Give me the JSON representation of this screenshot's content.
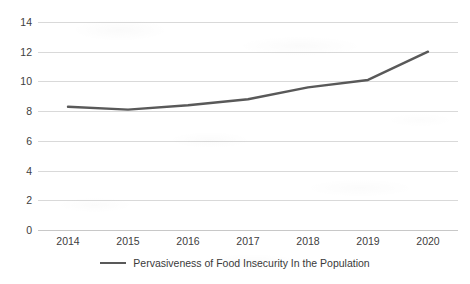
{
  "chart_data": {
    "type": "line",
    "title": "",
    "subtitle": "",
    "xlabel": "",
    "ylabel": "",
    "categories": [
      "2014",
      "2015",
      "2016",
      "2017",
      "2018",
      "2019",
      "2020"
    ],
    "series": [
      {
        "name": "Pervasiveness of Food Insecurity In the Population",
        "color": "#595959",
        "values": [
          8.3,
          8.1,
          8.4,
          8.8,
          9.6,
          10.1,
          12.0
        ]
      }
    ],
    "ylim": [
      0,
      14
    ],
    "ytick_values": [
      14,
      12,
      10,
      8,
      6,
      4,
      2,
      0
    ],
    "ytick_labels": [
      "14",
      "12",
      "10",
      "8",
      "6",
      "4",
      "2",
      "0"
    ],
    "ytick_step": 2,
    "grid": true,
    "grid_axis": "y",
    "grid_color": "#d9d9d9",
    "legend": true,
    "legend_position": "bottom",
    "markers": false,
    "background_color": "#ffffff"
  },
  "legend": {
    "entries": [
      {
        "label": "Pervasiveness of Food Insecurity In the Population"
      }
    ]
  }
}
